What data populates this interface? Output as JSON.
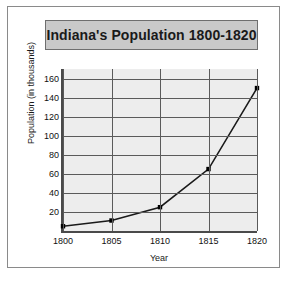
{
  "figure": {
    "title": "Indiana's Population 1800-1820",
    "background_color": "#ffffff",
    "border_color": "#8a8a8a",
    "title_background_color": "#c9c9c9"
  },
  "chart_data": {
    "type": "line",
    "title": "Indiana's Population 1800-1820",
    "xlabel": "Year",
    "ylabel": "Population (in thousands)",
    "x": [
      1800,
      1805,
      1810,
      1815,
      1820
    ],
    "values": [
      5,
      11,
      25,
      65,
      150
    ],
    "categories": [
      "1800",
      "1805",
      "1810",
      "1815",
      "1820"
    ],
    "xlim": [
      1800,
      1820
    ],
    "ylim": [
      0,
      170
    ],
    "xticks": [
      "1800",
      "1805",
      "1810",
      "1815",
      "1820"
    ],
    "yticks": [
      "20",
      "40",
      "60",
      "80",
      "100",
      "120",
      "140",
      "160"
    ],
    "ytick_values": [
      20,
      40,
      60,
      80,
      100,
      120,
      140,
      160
    ],
    "grid": true,
    "legend": "none",
    "line_color": "#1a1a1a",
    "marker": "square",
    "marker_color": "#000000",
    "plot_background_color": "#ededed",
    "gridline_color": "#5a5a5a",
    "axis_color": "#4a4a4a"
  }
}
